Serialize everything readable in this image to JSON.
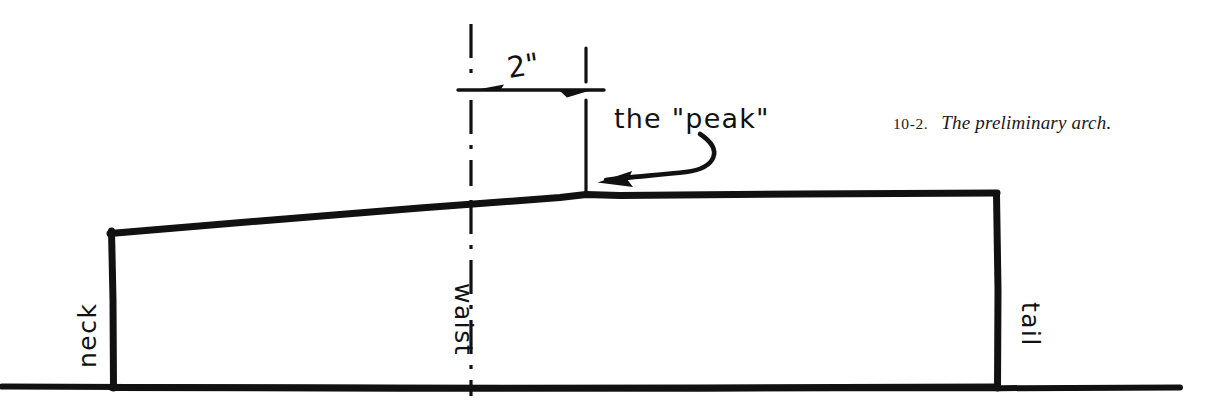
{
  "figure": {
    "domain": "Diagram",
    "background_color": "#ffffff",
    "ink_color": "#111111",
    "caption": {
      "number": "10-2.",
      "text": "The preliminary arch."
    },
    "annotations": {
      "dimension_label": "2\"",
      "callout_label": "the \"peak\"",
      "neck_label": "neck",
      "waist_label": "waist",
      "tail_label": "tail"
    },
    "geometry": {
      "ground_line": {
        "x1": 0,
        "y1": 388,
        "x2": 1180,
        "y2": 388
      },
      "neck_post": {
        "x": 112,
        "y_top": 232,
        "y_bottom": 390
      },
      "tail_post": {
        "x": 997,
        "y_top": 193,
        "y_bottom": 390
      },
      "top_profile": [
        {
          "x": 110,
          "y": 233
        },
        {
          "x": 585,
          "y": 195
        },
        {
          "x": 997,
          "y": 193
        }
      ],
      "bottom_profile": [
        {
          "x": 112,
          "y": 388
        },
        {
          "x": 997,
          "y": 387
        }
      ],
      "waist_centerline": {
        "x": 471,
        "y_top": 24,
        "y_bottom": 395
      },
      "peak_line": {
        "x": 586,
        "y_top": 48,
        "y_bottom": 194
      },
      "dimension_line": {
        "x1": 458,
        "x2": 604,
        "y": 90
      },
      "callout_arrow_tip": {
        "x": 598,
        "y": 182
      }
    }
  }
}
